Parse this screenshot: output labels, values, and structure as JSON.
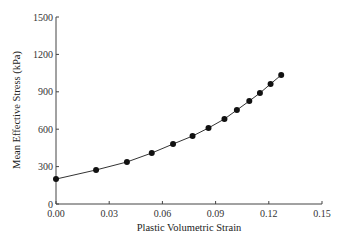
{
  "chart_data": {
    "type": "line",
    "title": "",
    "xlabel": "Plastic Volumetric Strain",
    "ylabel": "Mean Effective Stress (kPa)",
    "xlim": [
      0,
      0.15
    ],
    "ylim": [
      0,
      1500
    ],
    "xticks": [
      "0.00",
      "0.03",
      "0.06",
      "0.09",
      "0.12",
      "0.15"
    ],
    "yticks": [
      "0",
      "300",
      "600",
      "900",
      "1200",
      "1500"
    ],
    "grid": false,
    "legend": null,
    "series": [
      {
        "name": "Mean Effective Stress",
        "marker": "circle",
        "x": [
          0.0,
          0.0226,
          0.04,
          0.054,
          0.066,
          0.077,
          0.086,
          0.095,
          0.102,
          0.109,
          0.115,
          0.121,
          0.127
        ],
        "y": [
          200,
          273,
          337,
          409,
          481,
          545,
          610,
          682,
          754,
          826,
          890,
          963,
          1035
        ]
      }
    ]
  }
}
